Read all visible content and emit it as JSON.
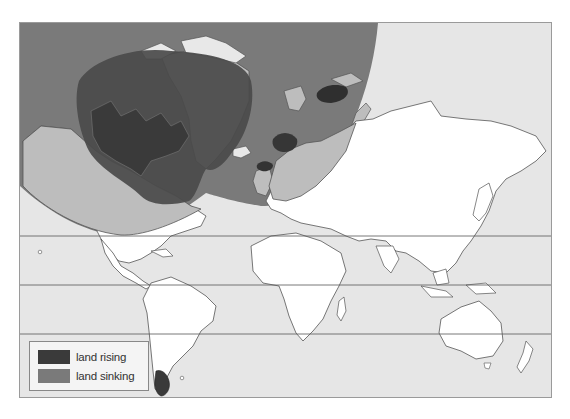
{
  "map": {
    "type": "world map (Mercator)",
    "subject": "Post-glacial isostatic land movement",
    "colors": {
      "ocean": "#e6e6e6",
      "land": "#ffffff",
      "land_outline": "#555555",
      "land_rising": "#3a3a3a",
      "land_sinking": "#7a7a7a",
      "sinking_zone_land": "#bdbdbd",
      "latitude_lines": "#555555",
      "frame": "#9a9a9a"
    },
    "regions_rising": [
      "Canada / Hudson Bay",
      "Scandinavia",
      "Barents Sea (Novaya Zemlya area)",
      "Scotland / British Isles",
      "Southern tip of South America"
    ],
    "regions_sinking": [
      "Arctic / North Atlantic / North Europe zone surrounding the rising areas"
    ],
    "latitude_lines_count": 3
  },
  "legend": {
    "items": [
      {
        "label": "land rising",
        "color": "#3a3a3a"
      },
      {
        "label": "land sinking",
        "color": "#7a7a7a"
      }
    ]
  }
}
